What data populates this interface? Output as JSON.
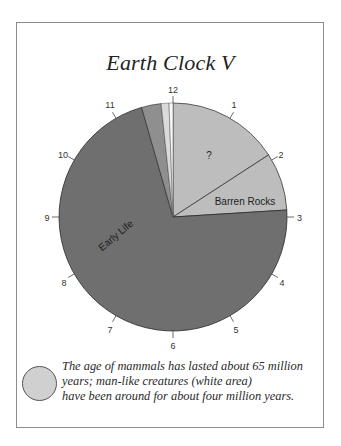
{
  "title": "Earth Clock V",
  "clock_numbers": [
    "12",
    "1",
    "2",
    "3",
    "4",
    "5",
    "6",
    "7",
    "8",
    "9",
    "10",
    "11"
  ],
  "slices": [
    {
      "label": "?",
      "start_deg": 0,
      "end_deg": 57,
      "color": "#bdbdbd"
    },
    {
      "label": "Barren Rocks",
      "start_deg": 57,
      "end_deg": 86.5,
      "color": "#bdbdbd"
    },
    {
      "label": "Early Life",
      "start_deg": 86.5,
      "end_deg": 344,
      "color": "#6f6f6f"
    },
    {
      "label": "",
      "start_deg": 344,
      "end_deg": 354,
      "color": "#8f8f8f"
    },
    {
      "label": "",
      "start_deg": 354,
      "end_deg": 358,
      "color": "#dadada"
    },
    {
      "label": "",
      "start_deg": 358,
      "end_deg": 360,
      "color": "#f8f8f8"
    }
  ],
  "labels": {
    "unknown": "?",
    "barren_rocks": "Barren Rocks",
    "early_life": "Early Life"
  },
  "caption": {
    "line1": "The age of mammals has lasted about 65 million",
    "line2": "years; man-like creatures (white area)",
    "line3": "have been around for about four million years."
  },
  "colors": {
    "early_life": "#6f6f6f",
    "barren_rocks": "#bdbdbd",
    "unknown": "#bdbdbd",
    "mammals": "#8f8f8f",
    "light_band": "#dadada",
    "man_like": "#f8f8f8",
    "caption_circle": "#d0d0d0"
  }
}
